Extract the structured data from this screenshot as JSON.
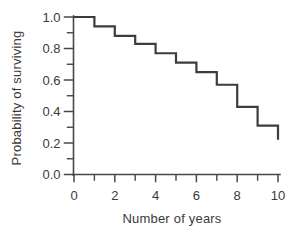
{
  "figure": {
    "background_color": "#ffffff",
    "curve_color": "#3d3d3d",
    "axis_color": "#474747",
    "text_color": "#3a3a3a"
  },
  "chart_data": {
    "type": "line",
    "subtype": "survival-step-curve",
    "title": "",
    "xlabel": "Number of years",
    "ylabel": "Probability of surviving",
    "xlim": [
      0,
      10
    ],
    "ylim": [
      0.0,
      1.0
    ],
    "grid": false,
    "legend": "none",
    "x_ticks": {
      "major": [
        0,
        2,
        4,
        6,
        8,
        10
      ],
      "major_labels": [
        "0",
        "2",
        "4",
        "6",
        "8",
        "10"
      ],
      "minor": [
        1,
        3,
        5,
        7,
        9
      ]
    },
    "y_ticks": {
      "major": [
        1.0,
        0.8,
        0.6,
        0.4,
        0.2,
        0.0
      ],
      "major_labels": [
        "1.0",
        "0.8",
        "0.6",
        "0.4",
        "0.2",
        "0.0"
      ],
      "minor": [
        0.9,
        0.7,
        0.5,
        0.3,
        0.1
      ]
    },
    "series": [
      {
        "name": "survival-curve",
        "interval_years": [
          [
            0,
            1
          ],
          [
            1,
            2
          ],
          [
            2,
            3
          ],
          [
            3,
            4
          ],
          [
            4,
            5
          ],
          [
            5,
            6
          ],
          [
            6,
            7
          ],
          [
            7,
            8
          ],
          [
            8,
            9
          ],
          [
            9,
            10
          ]
        ],
        "interval_probabilities": [
          1.0,
          0.94,
          0.88,
          0.83,
          0.77,
          0.71,
          0.65,
          0.57,
          0.43,
          0.31
        ],
        "drop_years": [
          1,
          2,
          3,
          4,
          5,
          6,
          7,
          8,
          9,
          10
        ],
        "final_year": 10,
        "final_probability": 0.22
      }
    ]
  }
}
